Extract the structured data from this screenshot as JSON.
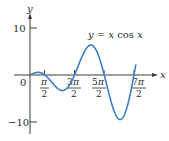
{
  "chart_data": {
    "type": "line",
    "title": "",
    "annotation": "y = x cos x",
    "xlabel": "x",
    "ylabel": "y",
    "function": "x*cos(x)",
    "xlim": [
      0,
      11.2
    ],
    "ylim": [
      -10.5,
      10.5
    ],
    "origin_label": "0",
    "x_ticks": [
      {
        "value": 1.5708,
        "num": "π",
        "den": "2"
      },
      {
        "value": 4.7124,
        "num": "3π",
        "den": "2"
      },
      {
        "value": 7.854,
        "num": "5π",
        "den": "2"
      },
      {
        "value": 10.9956,
        "num": "7π",
        "den": "2"
      }
    ],
    "y_ticks": [
      {
        "value": 10,
        "label": "10"
      },
      {
        "value": -10,
        "label": "-10"
      }
    ],
    "x": [
      0,
      0.5,
      0.86,
      1.2,
      1.5708,
      2.0,
      2.5,
      3.0,
      3.43,
      4.0,
      4.7124,
      5.5,
      6.44,
      7.0,
      7.854,
      8.5,
      9.53,
      10.2,
      10.9956,
      11.2
    ],
    "values": [
      0,
      0.44,
      0.56,
      0.43,
      0,
      -0.83,
      -2.0,
      -2.97,
      -3.43,
      -2.61,
      0,
      3.89,
      6.36,
      5.28,
      0,
      -5.25,
      -9.48,
      -7.24,
      0,
      2.55
    ],
    "grid": false,
    "legend": null,
    "colors": {
      "curve": "#3d7fc4",
      "axis": "#3a3a3a"
    }
  },
  "labels": {
    "y_axis": "y",
    "x_axis": "x",
    "origin": "0",
    "y_tick_top": "10",
    "y_tick_bottom": "−10",
    "annotation_y": "y",
    "annotation_eq": " = ",
    "annotation_x": "x",
    "annotation_cos": " cos ",
    "annotation_x2": "x",
    "tick1_num": "π",
    "tick1_den": "2",
    "tick2_num_coef": "3",
    "tick2_num_pi": "π",
    "tick2_den": "2",
    "tick3_num_coef": "5",
    "tick3_num_pi": "π",
    "tick3_den": "2",
    "tick4_num_coef": "7",
    "tick4_num_pi": "π",
    "tick4_den": "2"
  }
}
